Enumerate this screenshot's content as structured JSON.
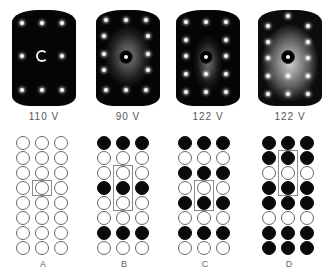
{
  "figure": {
    "leed_patterns": [
      {
        "id": "leed-1",
        "voltage": "110 V",
        "style": "dark-sharp"
      },
      {
        "id": "leed-2",
        "voltage": "90 V",
        "style": "diffuse-streaks"
      },
      {
        "id": "leed-3",
        "voltage": "122 V",
        "style": "moderate-diffuse"
      },
      {
        "id": "leed-4",
        "voltage": "122 V",
        "style": "bright-diffuse"
      }
    ],
    "models": [
      {
        "label": "A",
        "rows": [
          [
            0,
            0,
            0
          ],
          [
            0,
            0,
            0
          ],
          [
            0,
            0,
            0
          ],
          [
            0,
            0,
            0
          ],
          [
            0,
            0,
            0
          ],
          [
            0,
            0,
            0
          ],
          [
            0,
            0,
            0
          ],
          [
            0,
            0,
            0
          ]
        ],
        "unit_cell_rows": [
          3,
          3
        ]
      },
      {
        "label": "B",
        "rows": [
          [
            1,
            1,
            1
          ],
          [
            0,
            0,
            0
          ],
          [
            0,
            0,
            0
          ],
          [
            1,
            1,
            1
          ],
          [
            0,
            0,
            0
          ],
          [
            0,
            0,
            0
          ],
          [
            1,
            1,
            1
          ],
          [
            0,
            0,
            0
          ]
        ],
        "unit_cell_rows": [
          2,
          4
        ]
      },
      {
        "label": "C",
        "rows": [
          [
            1,
            1,
            1
          ],
          [
            0,
            0,
            0
          ],
          [
            1,
            1,
            1
          ],
          [
            0,
            0,
            0
          ],
          [
            1,
            1,
            1
          ],
          [
            0,
            0,
            0
          ],
          [
            1,
            1,
            1
          ],
          [
            0,
            0,
            0
          ]
        ],
        "unit_cell_rows": [
          3,
          4
        ]
      },
      {
        "label": "D",
        "rows": [
          [
            1,
            1,
            1
          ],
          [
            1,
            1,
            1
          ],
          [
            0,
            0,
            0
          ],
          [
            1,
            1,
            1
          ],
          [
            1,
            1,
            1
          ],
          [
            0,
            0,
            0
          ],
          [
            1,
            1,
            1
          ],
          [
            1,
            1,
            1
          ]
        ],
        "unit_cell_rows": [
          1,
          3
        ]
      }
    ]
  }
}
